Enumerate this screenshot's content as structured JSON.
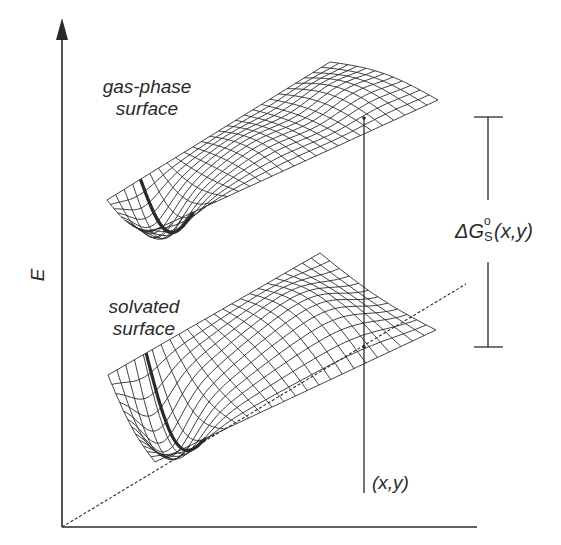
{
  "figure": {
    "axis": {
      "y_label": "E",
      "origin": [
        62,
        527
      ],
      "x_axis_end": [
        477,
        527
      ],
      "y_axis_end": [
        62,
        14
      ]
    },
    "surfaces": [
      {
        "id": "gas-phase",
        "label_line1": "gas-phase",
        "label_line2": "surface"
      },
      {
        "id": "solvated",
        "label_line1": "solvated",
        "label_line2": "surface"
      }
    ],
    "delta_g": {
      "symbol": "ΔG",
      "superscript": "o",
      "subscript": "S",
      "argument": "(x,y)",
      "bracket_top_y": 117,
      "bracket_bottom_y": 347,
      "bracket_x": 488
    },
    "point_label": "(x,y)",
    "colors": {
      "ink": "#2a2a2a",
      "background": "#ffffff"
    }
  }
}
